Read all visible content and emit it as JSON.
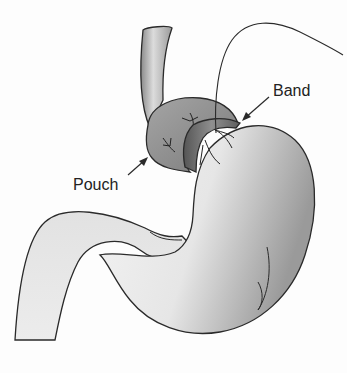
{
  "diagram": {
    "labels": {
      "band": "Band",
      "pouch": "Pouch"
    },
    "parts": [
      {
        "id": "esophagus",
        "name": "Esophagus"
      },
      {
        "id": "pouch",
        "name": "Pouch"
      },
      {
        "id": "band",
        "name": "Band"
      },
      {
        "id": "stomach",
        "name": "Stomach"
      },
      {
        "id": "duodenum",
        "name": "Duodenum"
      },
      {
        "id": "tube",
        "name": "Access tubing"
      }
    ],
    "colors": {
      "outline": "#2a2a2a",
      "stomach_fill_light": "#f4f4f4",
      "stomach_fill_dark": "#a9a9a9",
      "pouch_fill": "#8c8c8c",
      "band_fill": "#6e6e6e",
      "esophagus_fill": "#bdbdbd",
      "background": "#fdfdfd"
    }
  }
}
